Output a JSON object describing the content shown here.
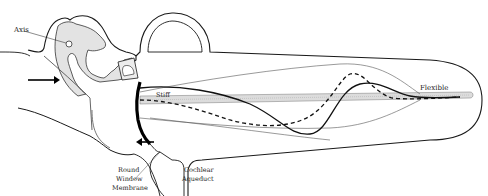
{
  "diagram": {
    "labels": {
      "axis": "Axis",
      "stiff": "Stiff",
      "flexible": "Flexible",
      "round_window_1": "Round",
      "round_window_2": "Window",
      "round_window_3": "Membrane",
      "cochlear_aqueduct_1": "Cochlear",
      "cochlear_aqueduct_2": "Aqueduct"
    },
    "arrows": [
      {
        "name": "input-arrow",
        "direction": "right"
      },
      {
        "name": "round-window-arrow",
        "direction": "left"
      }
    ],
    "colors": {
      "line": "#1a1a1a",
      "thin_line": "#555555",
      "shading": "#d9d9d9",
      "background": "#ffffff"
    },
    "wave_styles": [
      "solid",
      "dashed"
    ]
  }
}
